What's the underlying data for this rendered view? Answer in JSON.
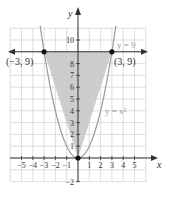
{
  "chart_data": {
    "type": "line",
    "title": "",
    "xlabel": "x",
    "ylabel": "y",
    "xlim": [
      -6,
      6
    ],
    "ylim": [
      -2,
      11
    ],
    "grid": true,
    "x_ticks": [
      -5,
      -4,
      -3,
      -2,
      -1,
      1,
      2,
      3,
      4,
      5
    ],
    "y_ticks": [
      -2,
      1,
      2,
      3,
      4,
      5,
      6,
      7,
      8,
      10
    ],
    "x_tick_labels": [
      "−5",
      "−4",
      "−3",
      "−2",
      "−1",
      "1",
      "2",
      "3",
      "4",
      "5"
    ],
    "y_tick_labels": [
      "−2",
      "1",
      "2",
      "3",
      "4",
      "5",
      "6",
      "7",
      "8",
      "10"
    ],
    "series": [
      {
        "name": "y = x²",
        "equation": "y = x^2",
        "color": "#9a9a9a"
      },
      {
        "name": "y = 9",
        "equation": "y = 9",
        "color": "#333333"
      }
    ],
    "shaded_region": {
      "vertices": [
        [
          0,
          0
        ],
        [
          -3,
          9
        ],
        [
          3,
          9
        ]
      ],
      "color": "#c8c8c8"
    },
    "points": [
      {
        "label": "(−3, 9)",
        "x": -3,
        "y": 9
      },
      {
        "label": "(3, 9)",
        "x": 3,
        "y": 9
      },
      {
        "label": "",
        "x": 0,
        "y": 0
      }
    ],
    "annotations": [
      {
        "text": "y = 9",
        "near": [
          4.5,
          9.5
        ]
      },
      {
        "text": "y = x²",
        "near": [
          3.5,
          4
        ]
      }
    ]
  },
  "labels": {
    "x_axis": "x",
    "y_axis": "y",
    "line_label": "y = 9",
    "curve_label": "y = x²",
    "point_left": "(−3, 9)",
    "point_right": "(3, 9)"
  }
}
